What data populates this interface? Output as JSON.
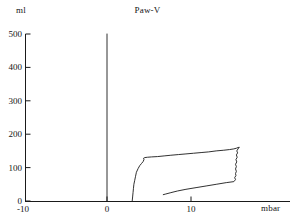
{
  "chart_data": {
    "type": "line",
    "title": "Paw-V",
    "xlabel": "mbar",
    "ylabel": "ml",
    "xlim": [
      -10,
      20
    ],
    "ylim": [
      0,
      500
    ],
    "xticks": [
      -10,
      0,
      10
    ],
    "xtick_labels": [
      "-10",
      "0",
      "10"
    ],
    "yticks": [
      0,
      100,
      200,
      300,
      400,
      500
    ],
    "ytick_labels": [
      "0",
      "100",
      "200",
      "300",
      "400",
      "500"
    ],
    "grid": false,
    "legend": null,
    "axis_color": "#1a1a1a",
    "line_color": "#1a1a1a",
    "series": [
      {
        "name": "zero-pressure-volume-line",
        "comment": "vertical reference line at 0 mbar",
        "points": [
          [
            0,
            0
          ],
          [
            0,
            500
          ]
        ]
      },
      {
        "name": "Paw-V loop",
        "comment": "airway-pressure / volume loop, inspiratory limb then expiratory limb",
        "points": [
          [
            3.0,
            0
          ],
          [
            3.05,
            12
          ],
          [
            3.1,
            25
          ],
          [
            3.15,
            38
          ],
          [
            3.2,
            50
          ],
          [
            3.3,
            62
          ],
          [
            3.4,
            74
          ],
          [
            3.5,
            86
          ],
          [
            3.7,
            97
          ],
          [
            3.9,
            106
          ],
          [
            4.1,
            112
          ],
          [
            4.3,
            118
          ],
          [
            4.4,
            124
          ],
          [
            4.35,
            128
          ],
          [
            4.5,
            130
          ],
          [
            4.8,
            131
          ],
          [
            5.3,
            132
          ],
          [
            6.0,
            133
          ],
          [
            6.8,
            135
          ],
          [
            7.6,
            137
          ],
          [
            8.5,
            139
          ],
          [
            9.4,
            141
          ],
          [
            10.3,
            143
          ],
          [
            11.2,
            145
          ],
          [
            12.1,
            147
          ],
          [
            13.0,
            150
          ],
          [
            13.9,
            152
          ],
          [
            14.6,
            154
          ],
          [
            15.1,
            156
          ],
          [
            15.4,
            158
          ],
          [
            15.6,
            160
          ],
          [
            15.75,
            161
          ],
          [
            15.6,
            156
          ],
          [
            15.45,
            150
          ],
          [
            15.55,
            144
          ],
          [
            15.4,
            138
          ],
          [
            15.5,
            131
          ],
          [
            15.35,
            124
          ],
          [
            15.45,
            117
          ],
          [
            15.3,
            110
          ],
          [
            15.4,
            103
          ],
          [
            15.3,
            96
          ],
          [
            15.4,
            89
          ],
          [
            15.3,
            82
          ],
          [
            15.35,
            76
          ],
          [
            15.2,
            70
          ],
          [
            15.3,
            64
          ],
          [
            15.1,
            58
          ],
          [
            14.2,
            55
          ],
          [
            13.0,
            50
          ],
          [
            11.8,
            45
          ],
          [
            10.6,
            40
          ],
          [
            9.4,
            35
          ],
          [
            8.4,
            30
          ],
          [
            7.6,
            25
          ],
          [
            7.0,
            21
          ],
          [
            6.7,
            19
          ]
        ]
      }
    ]
  }
}
